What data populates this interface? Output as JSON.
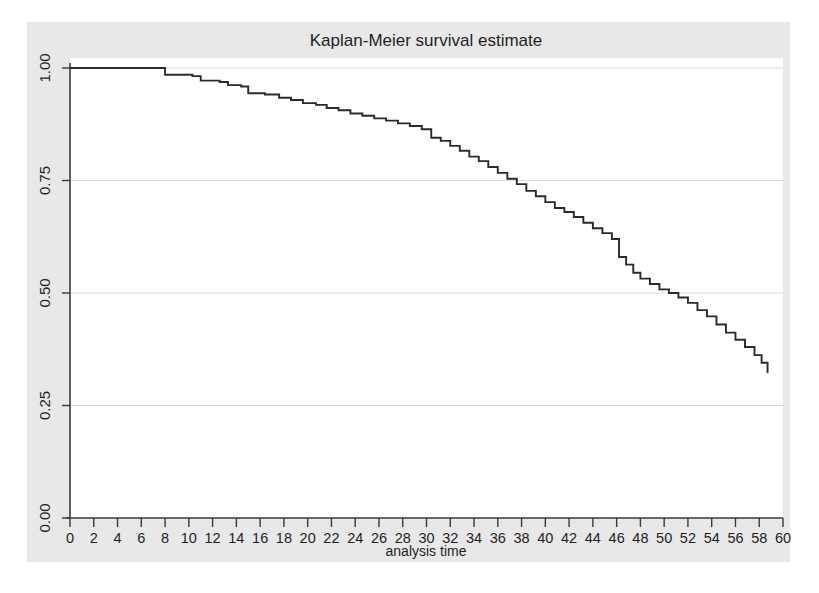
{
  "chart_data": {
    "type": "line",
    "subtype": "kaplan-meier-step",
    "title": "Kaplan-Meier survival estimate",
    "xlabel": "analysis time",
    "ylabel": "",
    "xlim": [
      0,
      60
    ],
    "ylim": [
      0,
      1
    ],
    "grid": true,
    "grid_axis": "y",
    "legend": "none",
    "x_ticks": [
      0,
      2,
      4,
      6,
      8,
      10,
      12,
      14,
      16,
      18,
      20,
      22,
      24,
      26,
      28,
      30,
      32,
      34,
      36,
      38,
      40,
      42,
      44,
      46,
      48,
      50,
      52,
      54,
      56,
      58,
      60
    ],
    "x_tick_labels": [
      "0",
      "2",
      "4",
      "6",
      "8",
      "10",
      "12",
      "14",
      "16",
      "18",
      "20",
      "22",
      "24",
      "26",
      "28",
      "30",
      "32",
      "34",
      "36",
      "38",
      "40",
      "42",
      "44",
      "46",
      "48",
      "50",
      "52",
      "54",
      "56",
      "58",
      "60"
    ],
    "y_ticks": [
      0.0,
      0.25,
      0.5,
      0.75,
      1.0
    ],
    "y_tick_labels": [
      "0.00",
      "0.25",
      "0.50",
      "0.75",
      "1.00"
    ],
    "line_color": "#2b2b2b",
    "background_color": "#e8e8e8",
    "plot_background_color": "#ffffff",
    "series_name": "survival probability",
    "x": [
      0.0,
      7.4,
      8.0,
      10.3,
      11.0,
      12.6,
      13.3,
      14.4,
      15.0,
      16.4,
      17.6,
      18.6,
      19.6,
      20.7,
      21.6,
      22.6,
      23.6,
      24.6,
      25.6,
      26.6,
      27.6,
      28.6,
      29.6,
      30.4,
      31.2,
      32.0,
      32.8,
      33.6,
      34.4,
      35.2,
      36.0,
      36.8,
      37.6,
      38.4,
      39.2,
      40.0,
      40.8,
      41.6,
      42.4,
      43.2,
      44.0,
      44.8,
      45.6,
      46.2,
      46.8,
      47.4,
      48.0,
      48.8,
      49.6,
      50.4,
      51.2,
      52.0,
      52.8,
      53.6,
      54.4,
      55.2,
      56.0,
      56.8,
      57.6,
      58.2,
      58.7
    ],
    "y": [
      1.0,
      1.0,
      0.985,
      0.982,
      0.972,
      0.969,
      0.962,
      0.959,
      0.944,
      0.941,
      0.934,
      0.929,
      0.922,
      0.918,
      0.911,
      0.906,
      0.899,
      0.894,
      0.888,
      0.883,
      0.877,
      0.871,
      0.864,
      0.845,
      0.838,
      0.827,
      0.816,
      0.803,
      0.793,
      0.78,
      0.767,
      0.754,
      0.742,
      0.727,
      0.715,
      0.702,
      0.689,
      0.68,
      0.669,
      0.656,
      0.644,
      0.633,
      0.62,
      0.58,
      0.563,
      0.545,
      0.532,
      0.52,
      0.508,
      0.5,
      0.49,
      0.478,
      0.462,
      0.448,
      0.43,
      0.412,
      0.396,
      0.38,
      0.362,
      0.345,
      0.322
    ]
  },
  "chart": {
    "title": "Kaplan-Meier survival estimate",
    "xaxis_title": "analysis time"
  }
}
